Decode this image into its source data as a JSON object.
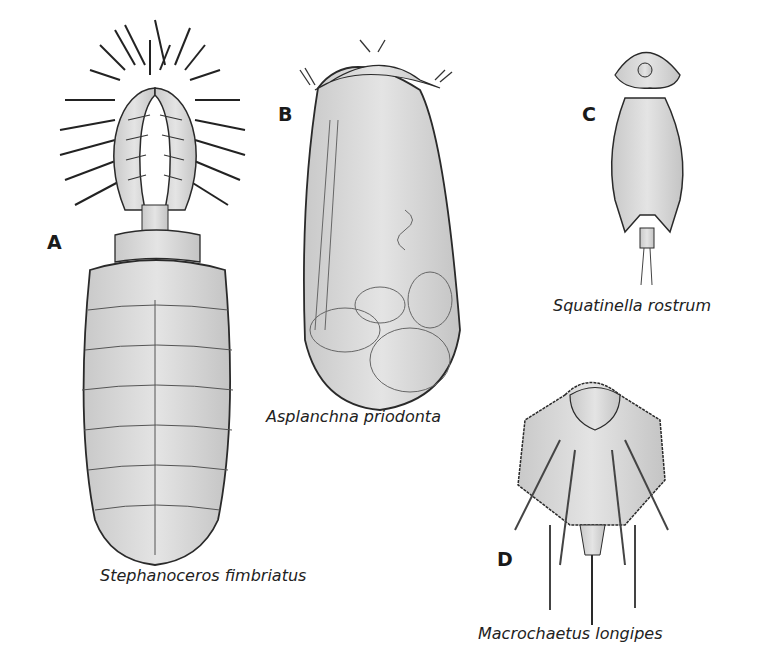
{
  "figure": {
    "panels": [
      {
        "letter": "A",
        "species": "Stephanoceros fimbriatus"
      },
      {
        "letter": "B",
        "species": "Asplanchna priodonta"
      },
      {
        "letter": "C",
        "species": "Squatinella rostrum"
      },
      {
        "letter": "D",
        "species": "Macrochaetus longipes"
      }
    ]
  },
  "colors": {
    "body_fill": "#d9d9d9",
    "outline": "#2a2a2a",
    "background": "#ffffff"
  }
}
